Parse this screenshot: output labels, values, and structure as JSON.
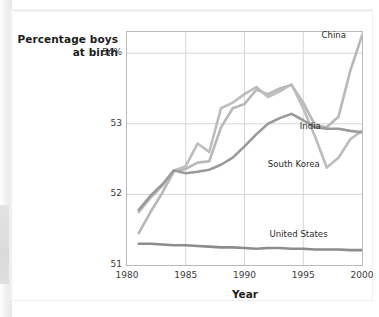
{
  "chart_data": {
    "type": "line",
    "title": "",
    "xlabel": "Year",
    "ylabel": "Percentage boys at birth",
    "ylabel_line1": "Percentage boys",
    "ylabel_line2": "at birth",
    "xlim": [
      1980,
      2000
    ],
    "ylim": [
      51,
      54.3
    ],
    "grid": true,
    "legend_position": "inline-annotations",
    "xticks": [
      "1980",
      "1985",
      "1990",
      "1995",
      "2000"
    ],
    "xtick_values": [
      1980,
      1985,
      1990,
      1995,
      2000
    ],
    "yticks": [
      "51",
      "52",
      "53",
      "54%"
    ],
    "ytick_values": [
      51,
      52,
      53,
      54
    ],
    "x": [
      1981,
      1982,
      1983,
      1984,
      1985,
      1986,
      1987,
      1988,
      1989,
      1990,
      1991,
      1992,
      1993,
      1994,
      1995,
      1996,
      1997,
      1998,
      1999,
      2000
    ],
    "series": [
      {
        "name": "China",
        "color": "#b8b8b8",
        "label_x": 1997.6,
        "label_y": 54.25,
        "values": [
          51.45,
          51.75,
          52.02,
          52.33,
          52.36,
          52.45,
          52.47,
          52.95,
          53.22,
          53.28,
          53.48,
          53.42,
          53.5,
          53.55,
          53.3,
          52.98,
          52.95,
          53.1,
          53.75,
          54.25
        ]
      },
      {
        "name": "South Korea",
        "color": "#bdbdbd",
        "label_x": 1994.2,
        "label_y": 52.42,
        "values": [
          51.75,
          51.95,
          52.12,
          52.34,
          52.4,
          52.72,
          52.6,
          53.22,
          53.3,
          53.42,
          53.52,
          53.38,
          53.46,
          53.56,
          53.22,
          52.82,
          52.38,
          52.52,
          52.78,
          52.9
        ]
      },
      {
        "name": "India",
        "color": "#9a9a9a",
        "label_x": 1995.6,
        "label_y": 52.95,
        "values": [
          51.78,
          51.98,
          52.14,
          52.34,
          52.3,
          52.32,
          52.35,
          52.42,
          52.52,
          52.68,
          52.85,
          53.0,
          53.08,
          53.14,
          53.05,
          52.95,
          52.93,
          52.93,
          52.9,
          52.88
        ]
      },
      {
        "name": "United States",
        "color": "#8c8c8c",
        "label_x": 1994.6,
        "label_y": 51.42,
        "values": [
          51.3,
          51.3,
          51.29,
          51.28,
          51.28,
          51.27,
          51.26,
          51.25,
          51.25,
          51.24,
          51.23,
          51.24,
          51.24,
          51.23,
          51.23,
          51.22,
          51.22,
          51.22,
          51.21,
          51.21
        ]
      }
    ]
  },
  "axes": {
    "y_title_line1": "Percentage boys",
    "y_title_line2": "at birth",
    "x_title": "Year"
  },
  "ticks": {
    "y": [
      "54%",
      "53",
      "52",
      "51"
    ],
    "x": [
      "1980",
      "1985",
      "1990",
      "1995",
      "2000"
    ]
  },
  "colors": {
    "frame": "#b9b9b9",
    "grid": "#d6d6d6",
    "text": "#1d1d1d",
    "background": "#ffffff"
  }
}
